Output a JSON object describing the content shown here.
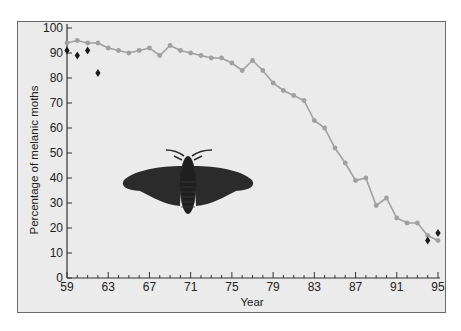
{
  "chart_data": {
    "type": "line",
    "title": "",
    "xlabel": "Year",
    "ylabel": "Percentage of melanic moths",
    "xlim": [
      59,
      95
    ],
    "ylim": [
      0,
      100
    ],
    "x_ticks": [
      "59",
      "63",
      "67",
      "71",
      "75",
      "79",
      "83",
      "87",
      "91",
      "95"
    ],
    "y_ticks": [
      "0",
      "10",
      "20",
      "30",
      "40",
      "50",
      "60",
      "70",
      "80",
      "90",
      "100"
    ],
    "grid": false,
    "legend": null,
    "series": [
      {
        "name": "melanic moth frequency (line)",
        "style": "gray line with circle markers",
        "color": "#a0a0a0",
        "x": [
          59,
          60,
          61,
          62,
          63,
          64,
          65,
          66,
          67,
          68,
          69,
          70,
          71,
          72,
          73,
          74,
          75,
          76,
          77,
          78,
          79,
          80,
          81,
          82,
          83,
          84,
          85,
          86,
          87,
          88,
          89,
          90,
          91,
          92,
          93,
          94,
          95
        ],
        "values": [
          94,
          95,
          94,
          94,
          92,
          91,
          90,
          91,
          92,
          89,
          93,
          91,
          90,
          89,
          88,
          88,
          86,
          83,
          87,
          83,
          78,
          75,
          73,
          71,
          63,
          60,
          52,
          46,
          39,
          40,
          29,
          32,
          24,
          22,
          22,
          17,
          15
        ]
      },
      {
        "name": "melanic moth frequency (diamond points)",
        "style": "black diamond markers",
        "color": "#1a1a1a",
        "x": [
          59,
          60,
          61,
          62,
          94,
          95
        ],
        "values": [
          91,
          89,
          91,
          82,
          15,
          18
        ]
      }
    ],
    "annotations": [
      "illustration of a dark (melanic) peppered moth inside plot area"
    ]
  },
  "axis": {
    "x_title": "Year",
    "y_title": "Percentage of melanic moths"
  },
  "illustration": {
    "name": "melanic-moth",
    "color": "#2b2b2b"
  }
}
